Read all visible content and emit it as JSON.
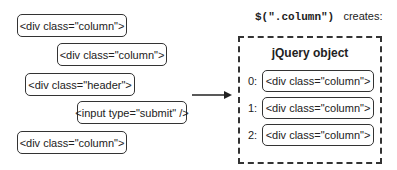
{
  "left_elements": [
    {
      "label": "<div class=\"column\">"
    },
    {
      "label": "<div class=\"column\">"
    },
    {
      "label": "<div class=\"header\">"
    },
    {
      "label": "<input type=\"submit\" />"
    },
    {
      "label": "<div class=\"column\">"
    }
  ],
  "selector": {
    "code": "$(\".column\")",
    "text": "creates:"
  },
  "jquery_object": {
    "title": "jQuery object",
    "items": [
      {
        "index": "0:",
        "label": "<div class=\"column\">"
      },
      {
        "index": "1:",
        "label": "<div class=\"column\">"
      },
      {
        "index": "2:",
        "label": "<div class=\"column\">"
      }
    ]
  }
}
